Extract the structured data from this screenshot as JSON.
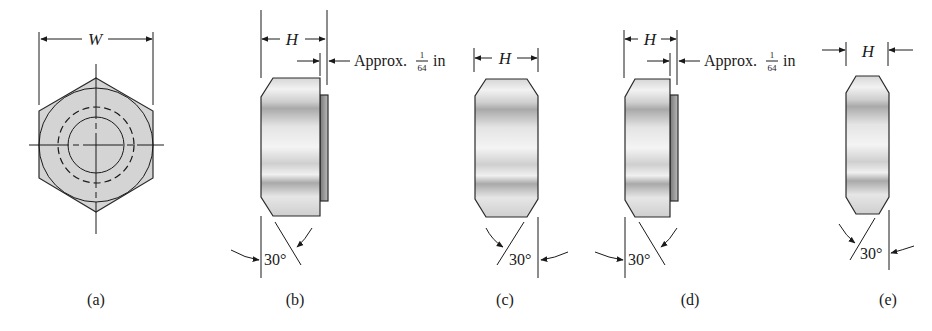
{
  "figure": {
    "panels": [
      {
        "id": "a",
        "caption": "(a)",
        "view": "top",
        "dimension_label": "W"
      },
      {
        "id": "b",
        "caption": "(b)",
        "view": "side-washer-faced",
        "dimension_label": "H",
        "note": "Approx.",
        "note_fraction_num": "1",
        "note_fraction_den": "64",
        "note_unit": "in",
        "angle": "30°"
      },
      {
        "id": "c",
        "caption": "(c)",
        "view": "side-double-chamfered",
        "dimension_label": "H",
        "angle": "30°"
      },
      {
        "id": "d",
        "caption": "(d)",
        "view": "side-washer-faced-thin",
        "dimension_label": "H",
        "note": "Approx.",
        "note_fraction_num": "1",
        "note_fraction_den": "64",
        "note_unit": "in",
        "angle": "30°"
      },
      {
        "id": "e",
        "caption": "(e)",
        "view": "side-jam-nut",
        "dimension_label": "H",
        "angle": "30°"
      }
    ]
  },
  "colors": {
    "line": "#1a1a1a",
    "fill_top": "#d4d4d4",
    "fill_side_light": "#eeeeee",
    "fill_side_dark": "#a8a8a8"
  }
}
